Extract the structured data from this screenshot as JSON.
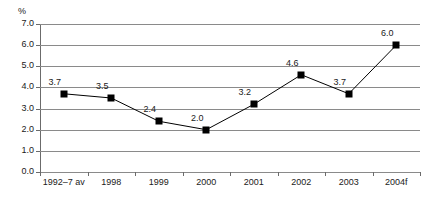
{
  "chart_data": {
    "type": "line",
    "title": "",
    "xlabel": "",
    "ylabel": "%",
    "categories": [
      "1992–7 av",
      "1998",
      "1999",
      "2000",
      "2001",
      "2002",
      "2003",
      "2004f"
    ],
    "values": [
      3.7,
      3.5,
      2.4,
      2.0,
      3.2,
      4.6,
      3.7,
      6.0
    ],
    "point_labels": [
      "3.7",
      "3.5",
      "2.4",
      "2.0",
      "3.2",
      "4.6",
      "3.7",
      "6.0"
    ],
    "ylim": [
      0.0,
      7.0
    ],
    "y_ticks": [
      0.0,
      1.0,
      2.0,
      3.0,
      4.0,
      5.0,
      6.0,
      7.0
    ],
    "y_tick_labels": [
      "0.0",
      "1.0",
      "2.0",
      "3.0",
      "4.0",
      "5.0",
      "6.0",
      "7.0"
    ],
    "grid": true,
    "legend": "none",
    "marker": "square",
    "series": [
      {
        "name": "",
        "values": [
          3.7,
          3.5,
          2.4,
          2.0,
          3.2,
          4.6,
          3.7,
          6.0
        ]
      }
    ],
    "colors": {
      "line": "#000000",
      "marker": "#000000",
      "grid": "#8a8a8a",
      "axis": "#6b6b6b",
      "text": "#1a1a1a",
      "background": "#ffffff"
    }
  }
}
